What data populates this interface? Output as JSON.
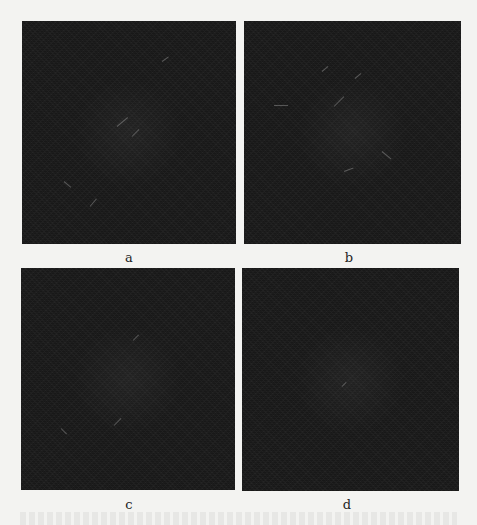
{
  "figure": {
    "header_fragment": "",
    "panels": [
      {
        "id": "a",
        "label": "a"
      },
      {
        "id": "b",
        "label": "b"
      },
      {
        "id": "c",
        "label": "c"
      },
      {
        "id": "d",
        "label": "d"
      }
    ],
    "colors": {
      "page_background": "#f3f3f1",
      "panel_background": "#1c1c1c",
      "label_color": "#1e1e1e"
    }
  }
}
